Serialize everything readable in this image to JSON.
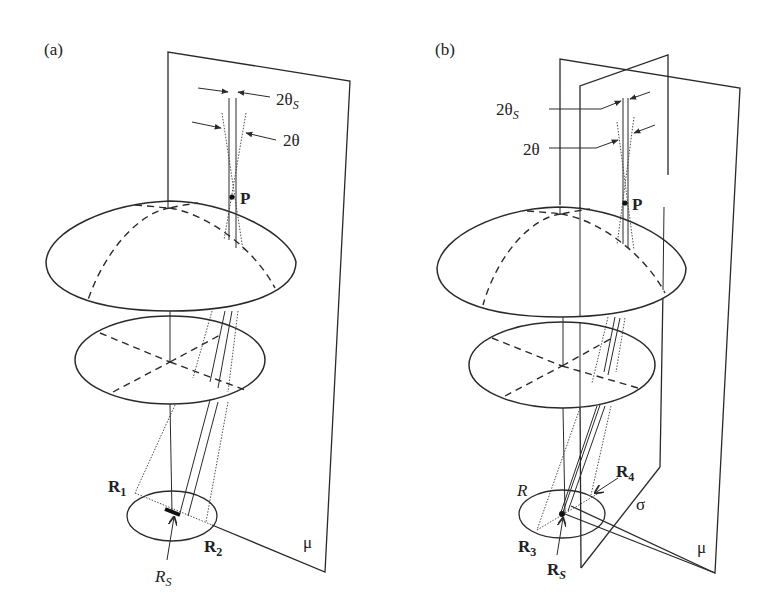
{
  "figure": {
    "panels": [
      {
        "id": "a",
        "label": "(a)",
        "annotations": {
          "angle_source": {
            "base": "2θ",
            "sub": "S"
          },
          "angle": "2θ",
          "point": "P",
          "R1": {
            "base": "R",
            "sub": "1"
          },
          "R2": {
            "base": "R",
            "sub": "2"
          },
          "RS": {
            "base": "R",
            "sub": "S"
          },
          "plane": "μ"
        }
      },
      {
        "id": "b",
        "label": "(b)",
        "annotations": {
          "angle_source": {
            "base": "2θ",
            "sub": "S"
          },
          "angle": "2θ",
          "point": "P",
          "R": "R",
          "R3": {
            "base": "R",
            "sub": "3"
          },
          "R4": {
            "base": "R",
            "sub": "4"
          },
          "RS": {
            "base": "R",
            "sub": "S"
          },
          "plane_sigma": "σ",
          "plane_mu": "μ"
        }
      }
    ],
    "colors": {
      "ink": "#2a2a2a",
      "background": "#ffffff"
    }
  }
}
